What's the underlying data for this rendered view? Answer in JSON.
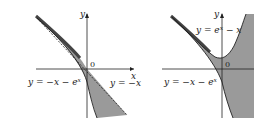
{
  "panels": [
    {
      "id": "left",
      "axis_labels": {
        "x": "x",
        "y": "y"
      },
      "origin_label": "0",
      "curves": [
        {
          "name": "curve-neg-x-minus-exp",
          "label": "y = −x − e^x",
          "style": "solid"
        },
        {
          "name": "line-neg-x",
          "label": "y = −x",
          "style": "dashed"
        }
      ],
      "shaded": "region between y = −x − e^x and y = −x"
    },
    {
      "id": "right",
      "axis_labels": {
        "x": "x",
        "y": "y"
      },
      "origin_label": "0",
      "curves": [
        {
          "name": "curve-exp-minus-x",
          "label": "y = e^x − x",
          "style": "solid"
        },
        {
          "name": "curve-neg-x-minus-exp",
          "label": "y = −x − e^x",
          "style": "solid"
        }
      ],
      "shaded": "region below y = e^x − x and above... outside region bounded by both curves"
    }
  ],
  "text": {
    "left_y": "y",
    "left_x": "x",
    "left_origin": "0",
    "left_curve1": "y = −x − e",
    "left_curve1_sup": "x",
    "left_curve2": "y = −x",
    "right_y": "y",
    "right_origin": "0",
    "right_curve1": "y = e",
    "right_curve1_sup": "x",
    "right_curve1_tail": " − x",
    "right_curve2": "y = −x − e",
    "right_curve2_sup": "x"
  },
  "colors": {
    "shade": "#9a9a9a",
    "line": "#222222",
    "band": "#555555"
  }
}
